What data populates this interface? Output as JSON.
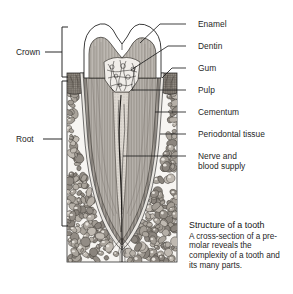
{
  "figure": {
    "title": "Structure of a tooth"
  },
  "side_labels": [
    {
      "id": "crown",
      "label": "Crown"
    },
    {
      "id": "root",
      "label": "Root"
    }
  ],
  "part_labels": [
    {
      "id": "enamel",
      "label": "Enamel"
    },
    {
      "id": "dentin",
      "label": "Dentin"
    },
    {
      "id": "gum",
      "label": "Gum"
    },
    {
      "id": "pulp",
      "label": "Pulp"
    },
    {
      "id": "cementum",
      "label": "Cementum"
    },
    {
      "id": "periodontal-tissue",
      "label": "Periodontal tissue"
    },
    {
      "id": "nerve-blood-supply",
      "label": "Nerve and\nblood supply"
    }
  ],
  "caption": {
    "title": "Structure of a tooth",
    "body": "A cross-section of a pre-molar reveals the complexity of a tooth and its many parts."
  },
  "colors": {
    "ink": "#1f1f1f",
    "line": "#3a3a3a",
    "enamel": "#ffffff",
    "dentin": "#b8b3ad",
    "pulp": "#ded9d2",
    "bone": "#f4f2ee",
    "bone_stone": "#9c968f",
    "gum": "#6f6962"
  }
}
